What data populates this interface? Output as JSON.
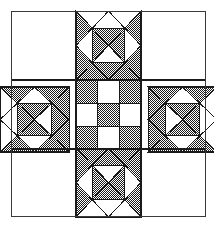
{
  "canvas": {
    "width": 214,
    "height": 225,
    "background": "#ffffff"
  },
  "artwork": {
    "title": "Ohio Star Quilt Block",
    "description": "Nine-patch quilt block diagram with dithered half-tone shading",
    "style": "line-art black and white quilting pattern diagram"
  },
  "frame": {
    "x": 11,
    "y": 11,
    "width": 195,
    "height": 206,
    "stroke": "#3a3a3a",
    "stroke_width": 1.6,
    "fill": "#ffffff"
  },
  "grid": {
    "columns": 3,
    "rows": 3,
    "x_edges": [
      11,
      76,
      141,
      206
    ],
    "y_edges": [
      11,
      80,
      149,
      217
    ],
    "divider_stroke": "#1a1a1a",
    "divider_width": 1.2
  },
  "palette": {
    "light": "#ffffff",
    "dark_pattern": "#2a2a2a",
    "dark_solid": "#555555",
    "outline": "#1a1a1a",
    "frame_line": "#3a3a3a"
  },
  "pattern": {
    "name": "halftone-checker-dither",
    "tile_size": 2,
    "dot_color": "#1c1c1c",
    "bg_color": "#ffffff",
    "coverage_percent": 50
  },
  "blocks": [
    {
      "id": "corner-top-left",
      "position": "top-left",
      "type": "plain-square",
      "fill": "light",
      "cell": [
        0,
        0
      ]
    },
    {
      "id": "star-point-top",
      "position": "top-center",
      "type": "hourglass-quad",
      "cell": [
        1,
        0
      ],
      "subcells": 4,
      "fill": "mixed"
    },
    {
      "id": "corner-top-right",
      "position": "top-right",
      "type": "plain-square",
      "fill": "light",
      "cell": [
        2,
        0
      ]
    },
    {
      "id": "star-point-left",
      "position": "middle-left",
      "type": "hourglass-quad",
      "cell": [
        0,
        1
      ],
      "subcells": 4,
      "fill": "mixed"
    },
    {
      "id": "center-ninepatch",
      "position": "center",
      "type": "checkerboard-9patch",
      "cell": [
        1,
        1
      ],
      "subcells": 9,
      "fill": "mixed"
    },
    {
      "id": "star-point-right",
      "position": "middle-right",
      "type": "hourglass-quad",
      "cell": [
        2,
        1
      ],
      "subcells": 4,
      "fill": "mixed"
    },
    {
      "id": "corner-bottom-left",
      "position": "bottom-left",
      "type": "plain-square",
      "fill": "light",
      "cell": [
        0,
        2
      ]
    },
    {
      "id": "star-point-bottom",
      "position": "bottom-center",
      "type": "hourglass-quad",
      "cell": [
        1,
        2
      ],
      "subcells": 4,
      "fill": "mixed"
    },
    {
      "id": "corner-bottom-right",
      "position": "bottom-right",
      "type": "plain-square",
      "fill": "light",
      "cell": [
        2,
        2
      ]
    }
  ],
  "center_checkerboard": {
    "rows": 3,
    "cols": 3,
    "cells": [
      [
        "dark",
        "light",
        "dark"
      ],
      [
        "light",
        "dark",
        "light"
      ],
      [
        "dark",
        "light",
        "dark"
      ]
    ]
  },
  "star_points": {
    "top": {
      "subblocks": [
        {
          "index": 0,
          "quadrant": "tl",
          "shading": "dark-outer-light-inner"
        },
        {
          "index": 1,
          "quadrant": "tr",
          "shading": "dark-outer-light-inner"
        },
        {
          "index": 2,
          "quadrant": "bl",
          "shading": "dark-outer-light-inner"
        },
        {
          "index": 3,
          "quadrant": "br",
          "shading": "dark-outer-light-inner"
        }
      ]
    },
    "left": {
      "mirror_of": "top",
      "rotation": 270
    },
    "right": {
      "mirror_of": "top",
      "rotation": 90
    },
    "bottom": {
      "mirror_of": "top",
      "rotation": 180
    }
  }
}
